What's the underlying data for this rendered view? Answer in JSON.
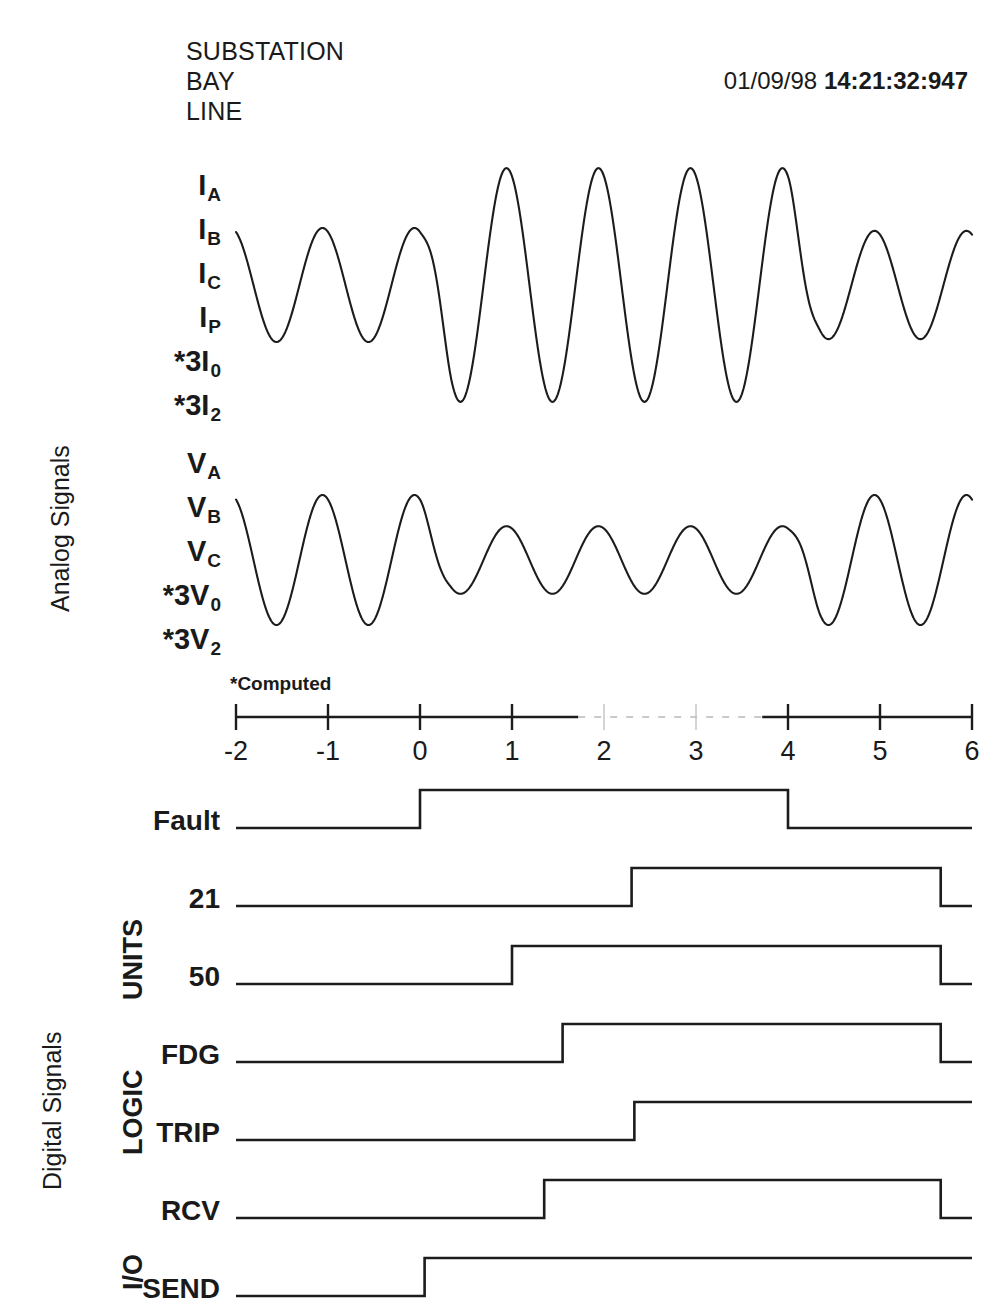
{
  "header": {
    "lines": [
      "SUBSTATION",
      "BAY",
      "LINE"
    ],
    "date": "01/09/98",
    "time": "14:21:32:947"
  },
  "sections": {
    "analog_label": "Analog Signals",
    "digital_label": "Digital Signals",
    "groups": [
      {
        "name": "UNITS"
      },
      {
        "name": "LOGIC"
      },
      {
        "name": "I/O"
      }
    ]
  },
  "analog": {
    "current_channels": [
      {
        "base": "I",
        "sub": "A"
      },
      {
        "base": "I",
        "sub": "B"
      },
      {
        "base": "I",
        "sub": "C"
      },
      {
        "base": "I",
        "sub": "P"
      },
      {
        "base": "*3I",
        "sub": "0"
      },
      {
        "base": "*3I",
        "sub": "2"
      }
    ],
    "voltage_channels": [
      {
        "base": "V",
        "sub": "A"
      },
      {
        "base": "V",
        "sub": "B"
      },
      {
        "base": "V",
        "sub": "C"
      },
      {
        "base": "*3V",
        "sub": "0"
      },
      {
        "base": "*3V",
        "sub": "2"
      }
    ],
    "footnote": "*Computed"
  },
  "digital": {
    "rows": [
      {
        "label": "Fault",
        "group": ""
      },
      {
        "label": "21",
        "group": "UNITS"
      },
      {
        "label": "50",
        "group": "UNITS"
      },
      {
        "label": "FDG",
        "group": "LOGIC"
      },
      {
        "label": "TRIP",
        "group": "LOGIC"
      },
      {
        "label": "RCV",
        "group": "I/O"
      },
      {
        "label": "SEND",
        "group": "I/O"
      }
    ]
  },
  "chart_data": {
    "type": "line",
    "xlabel": "",
    "ylabel": "",
    "grid": false,
    "legend": "none",
    "xlim": [
      -2,
      6
    ],
    "x_ticks": [
      -2,
      -1,
      0,
      1,
      2,
      3,
      4,
      5,
      6
    ],
    "x_tick_labels": [
      "-2",
      "-1",
      "0",
      "1",
      "2",
      "3",
      "4",
      "5",
      "6"
    ],
    "units_note": "cycles",
    "fault_window": [
      0,
      4
    ],
    "analog_series": [
      {
        "name": "current",
        "label": "I",
        "cycles_per_unit": 1,
        "phase_deg": 0,
        "prefault_amplitude": 1.0,
        "fault_amplitude": 2.05,
        "postfault_amplitude": 0.95,
        "fault_start": 0,
        "fault_end": 4,
        "ramp_cycles": 0.35
      },
      {
        "name": "voltage",
        "label": "V",
        "cycles_per_unit": 1,
        "phase_deg": 0,
        "prefault_amplitude": 1.0,
        "fault_amplitude": 0.52,
        "postfault_amplitude": 1.0,
        "fault_start": 0,
        "fault_end": 4,
        "ramp_cycles": 0.35
      }
    ],
    "digital_series": [
      {
        "name": "Fault",
        "rise": 0.0,
        "fall": 4.0,
        "final_state": 0
      },
      {
        "name": "21",
        "rise": 2.3,
        "fall": 5.66,
        "final_state": 0
      },
      {
        "name": "50",
        "rise": 1.0,
        "fall": 5.66,
        "final_state": 0
      },
      {
        "name": "FDG",
        "rise": 1.55,
        "fall": 5.66,
        "final_state": 0
      },
      {
        "name": "TRIP",
        "rise": 2.33,
        "fall": null,
        "final_state": 1
      },
      {
        "name": "RCV",
        "rise": 1.35,
        "fall": 5.66,
        "final_state": 0
      },
      {
        "name": "SEND",
        "rise": 0.05,
        "fall": null,
        "final_state": 1
      }
    ]
  }
}
